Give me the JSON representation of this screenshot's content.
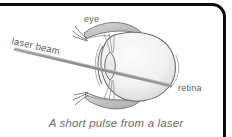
{
  "figure": {
    "caption": "A short pulse from a laser",
    "labels": {
      "eye": "eye",
      "retina": "retina",
      "laser_beam": "laser beam"
    },
    "colors": {
      "frame": "#0b0b0b",
      "background": "#ffffff",
      "label_text": "#5d5d5d",
      "caption_text": "#6b6b6b",
      "beam": "#8e8e8e",
      "outline": "#6f6f6f",
      "sclera_fill": "#f2f2f2",
      "eyelid_fill": "#c9c9c9",
      "lens_fill": "#ededed"
    },
    "parts": [
      {
        "name": "sclera",
        "label": ""
      },
      {
        "name": "lens",
        "label": ""
      },
      {
        "name": "cornea",
        "label": ""
      },
      {
        "name": "upper-eyelid",
        "label": "eye"
      },
      {
        "name": "lower-eyelid",
        "label": ""
      },
      {
        "name": "retina",
        "label": "retina"
      },
      {
        "name": "laser-beam",
        "label": "laser beam"
      }
    ]
  }
}
